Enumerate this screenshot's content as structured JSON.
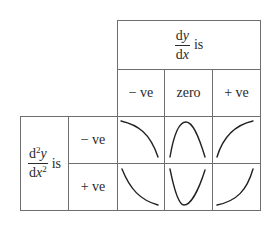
{
  "table": {
    "column_header": {
      "numerator": "d",
      "numerator_var": "y",
      "denominator": "d",
      "denominator_var": "x",
      "suffix": "is"
    },
    "columns": [
      "− ve",
      "zero",
      "+ ve"
    ],
    "row_header": {
      "numerator": "d",
      "numerator_sup": "2",
      "numerator_var": "y",
      "denominator": "d",
      "denominator_var": "x",
      "denominator_sup": "2",
      "suffix": "is"
    },
    "rows": [
      {
        "label": "− ve",
        "cells": [
          {
            "curve": "decreasing-concave-down"
          },
          {
            "curve": "maximum-arch"
          },
          {
            "curve": "increasing-concave-down"
          }
        ]
      },
      {
        "label": "+ ve",
        "cells": [
          {
            "curve": "decreasing-concave-up"
          },
          {
            "curve": "minimum-valley"
          },
          {
            "curve": "increasing-concave-up"
          }
        ]
      }
    ]
  },
  "colors": {
    "grid": "#6e6e6e",
    "text": "#2a2a2a",
    "curve": "#222222"
  }
}
